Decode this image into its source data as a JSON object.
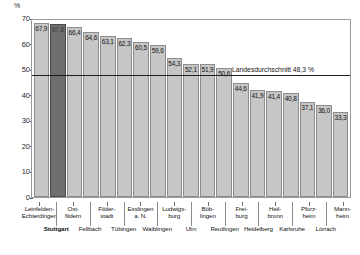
{
  "chart_data": {
    "type": "bar",
    "title": "",
    "xlabel": "",
    "ylabel": "%",
    "ylim": [
      0,
      70
    ],
    "ytick_values": [
      0,
      10,
      20,
      30,
      40,
      50,
      60,
      70
    ],
    "ytick_labels": [
      "0",
      "10",
      "20",
      "30",
      "40",
      "50",
      "60",
      "70"
    ],
    "grid": false,
    "legend": "none",
    "categories": [
      "Leinfelden-Echterdingen",
      "Stuttgart",
      "Ostfildern",
      "Fellbach",
      "Filderstadt",
      "Tübingen",
      "Esslingen a. N.",
      "Waiblingen",
      "Ludwigsburg",
      "Ulm",
      "Böblingen",
      "Reutlingen",
      "Freiburg",
      "Heidelberg",
      "Heilbronn",
      "Karlsruhe",
      "Pforzheim",
      "Lörrach",
      "Mannheim"
    ],
    "values": [
      67.9,
      67.8,
      66.4,
      64.6,
      63.1,
      62.3,
      60.5,
      59.6,
      54.3,
      52.1,
      51.9,
      50.6,
      44.6,
      41.9,
      41.4,
      40.8,
      37.1,
      36.0,
      33.3
    ],
    "value_labels": [
      "67,9",
      "67,8",
      "66,4",
      "64,6",
      "63,1",
      "62,3",
      "60,5",
      "59,6",
      "54,3",
      "52,1",
      "51,9",
      "50,6",
      "44,6",
      "41,9",
      "41,4",
      "40,8",
      "37,1",
      "36,0",
      "33,3"
    ],
    "highlight_index": 1,
    "reference_line": {
      "value": 48.3,
      "label": "Landesdurchschnitt 48,3 %"
    },
    "colors": {
      "bar": "#c6c6c6",
      "bar_border": "#8d8d8d",
      "bar_highlight": "#6e6e6e",
      "reference_line": "#1d1d1d",
      "frame": "#9a9a9a",
      "text": "#141414"
    }
  },
  "axis": {
    "unit_label": "%"
  },
  "category_label_lines": [
    [
      "Leinfelden-",
      "Echterdingen"
    ],
    [
      "Stuttgart"
    ],
    [
      "Ost-",
      "fildern"
    ],
    [
      "Fellbach"
    ],
    [
      "Filder-",
      "stadt"
    ],
    [
      "Tübingen"
    ],
    [
      "Esslingen",
      "a. N."
    ],
    [
      "Waiblingen"
    ],
    [
      "Ludwigs-",
      "burg"
    ],
    [
      "Ulm"
    ],
    [
      "Böb-",
      "lingen"
    ],
    [
      "Reutlingen"
    ],
    [
      "Frei-",
      "burg"
    ],
    [
      "Heidelberg"
    ],
    [
      "Heil-",
      "bronn"
    ],
    [
      "Karlsruhe"
    ],
    [
      "Pforz-",
      "heim"
    ],
    [
      "Lörrach"
    ],
    [
      "Mann-",
      "heim"
    ]
  ]
}
